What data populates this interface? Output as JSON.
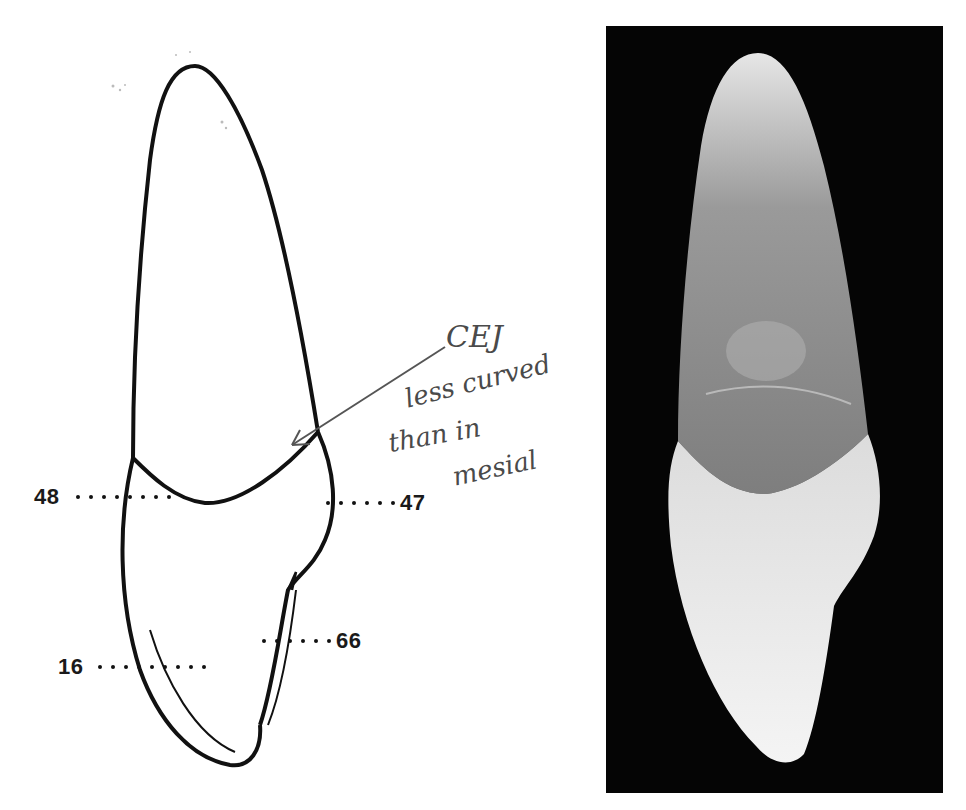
{
  "figure": {
    "drawing": {
      "measurement_labels": [
        {
          "id": "cervical-left",
          "value": "48"
        },
        {
          "id": "cervical-right",
          "value": "47"
        },
        {
          "id": "root-right",
          "value": "66"
        },
        {
          "id": "root-left",
          "value": "16"
        }
      ],
      "annotation": {
        "line1": "CEJ",
        "line2": "less curved",
        "line3": "than in",
        "line4": "mesial"
      }
    },
    "photo": {
      "description": "Photograph of extracted tooth on black background",
      "background_color": "#050505"
    },
    "colors": {
      "outline": "#111111",
      "annotation_ink": "#4a4a4a"
    }
  }
}
